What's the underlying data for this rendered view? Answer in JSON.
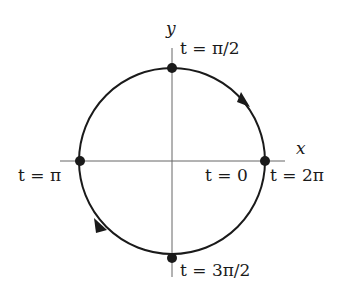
{
  "diagram": {
    "axes": {
      "x_label": "x",
      "y_label": "y"
    },
    "points": [
      {
        "id": "top",
        "label": "t = π/2"
      },
      {
        "id": "left",
        "label": "t = π"
      },
      {
        "id": "right_a",
        "label": "t = 0"
      },
      {
        "id": "right_b",
        "label": "t = 2π"
      },
      {
        "id": "bottom",
        "label": "t = 3π/2"
      }
    ],
    "direction": "clockwise",
    "colors": {
      "stroke": "#1a1a1a",
      "axis": "#555555",
      "background": "#ffffff"
    }
  }
}
